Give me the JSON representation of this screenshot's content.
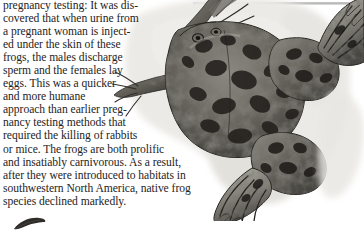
{
  "page": {
    "background_color": "#ffffff",
    "text_color": "#242424"
  },
  "body_text": {
    "lines": [
      "pregnancy testing: It was dis-",
      "covered that when urine from",
      "a pregnant woman is inject-",
      "ed under the skin of these",
      "frogs, the males discharge",
      "sperm and the females lay",
      "eggs. This was a quicker",
      "and more humane",
      "approach than earlier preg-",
      "nancy testing methods that",
      "required the killing of rabbits",
      "or mice. The frogs are both prolific",
      "and insatiably carnivorous. As a result,",
      "after they were introduced to habitats in",
      "southwestern North America, native frog",
      "species declined markedly."
    ]
  },
  "illustration": {
    "subject": "african-clawed-frog",
    "description": "Top-down ink-and-wash illustration of an African clawed frog (Xenopus laevis) with mottled dark spots, splayed forelimbs and large webbed hind feet, rendered over a pale gray watercolor wash shadow.",
    "colors": {
      "body_dark": "#3a3733",
      "body_mid": "#7d7a74",
      "body_light": "#b9b6ae",
      "wash_shadow": "#e4e3df",
      "outline": "#2b2926",
      "paper": "#ffffff"
    }
  },
  "top_rule": {
    "color": "#bcbcbc"
  },
  "next_figure_stub": {
    "color": "#2e2c29"
  }
}
